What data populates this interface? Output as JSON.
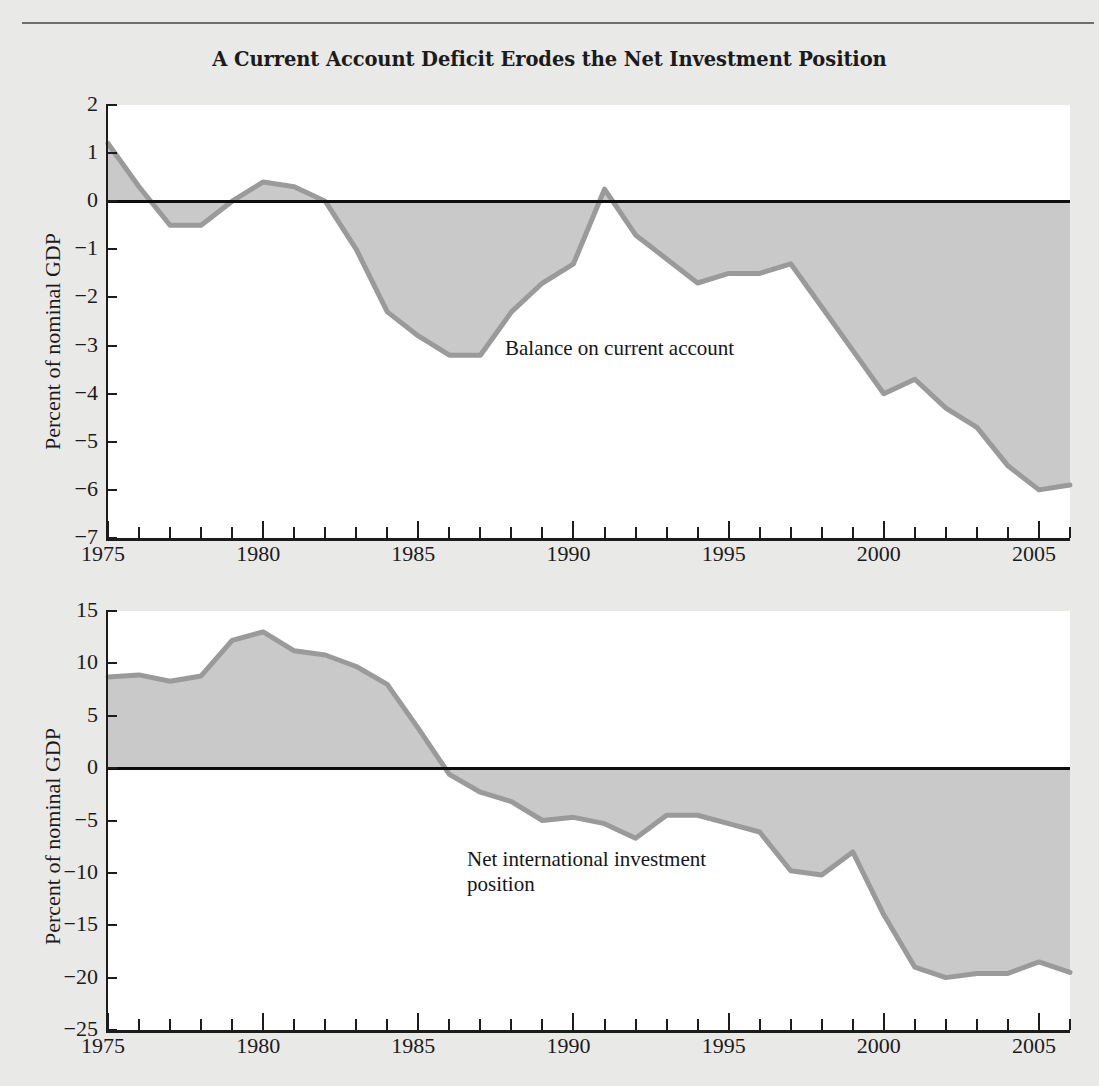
{
  "figure": {
    "title": "A Current Account Deficit Erodes the Net Investment Position",
    "background_color": "#e9e9e7",
    "plot_background_color": "#ffffff",
    "area_fill_color": "#c9c9c9",
    "series_line_color": "#9a9a9a",
    "axis_color": "#1c1c1c"
  },
  "chart_data": [
    {
      "type": "area",
      "panel": "top",
      "title": "A Current Account Deficit Erodes the Net Investment Position",
      "xlabel": "",
      "ylabel": "Percent of nominal GDP",
      "annotation": "Balance on current account",
      "legend_position": "inline-annotation",
      "grid": false,
      "xlim": [
        1975,
        2006
      ],
      "ylim": [
        -7,
        2
      ],
      "xticks_major": [
        1975,
        1980,
        1985,
        1990,
        1995,
        2000,
        2005
      ],
      "xticks_minor_step": 1,
      "ytick_labels": [
        "2",
        "1",
        "0",
        "−1",
        "−2",
        "−3",
        "−4",
        "−5",
        "−6",
        "−7"
      ],
      "yticks": [
        2,
        1,
        0,
        -1,
        -2,
        -3,
        -4,
        -5,
        -6,
        -7
      ],
      "x": [
        1975,
        1976,
        1977,
        1978,
        1979,
        1980,
        1981,
        1982,
        1983,
        1984,
        1985,
        1986,
        1987,
        1988,
        1989,
        1990,
        1991,
        1992,
        1993,
        1994,
        1995,
        1996,
        1997,
        1998,
        1999,
        2000,
        2001,
        2002,
        2003,
        2004,
        2005,
        2006
      ],
      "values": [
        1.2,
        0.3,
        -0.5,
        -0.5,
        0.0,
        0.4,
        0.3,
        0.0,
        -1.0,
        -2.3,
        -2.8,
        -3.2,
        -3.2,
        -2.3,
        -1.7,
        -1.3,
        0.25,
        -0.7,
        -1.2,
        -1.7,
        -1.5,
        -1.5,
        -1.3,
        -2.2,
        -3.1,
        -4.0,
        -3.7,
        -4.3,
        -4.7,
        -5.5,
        -6.0,
        -5.9
      ],
      "series": [
        {
          "name": "Balance on current account",
          "values": [
            1.2,
            0.3,
            -0.5,
            -0.5,
            0.0,
            0.4,
            0.3,
            0.0,
            -1.0,
            -2.3,
            -2.8,
            -3.2,
            -3.2,
            -2.3,
            -1.7,
            -1.3,
            0.25,
            -0.7,
            -1.2,
            -1.7,
            -1.5,
            -1.5,
            -1.3,
            -2.2,
            -3.1,
            -4.0,
            -3.7,
            -4.3,
            -4.7,
            -5.5,
            -6.0,
            -5.9
          ]
        }
      ]
    },
    {
      "type": "area",
      "panel": "bottom",
      "title": "",
      "xlabel": "",
      "ylabel": "Percent of nominal GDP",
      "annotation": "Net international investment\nposition",
      "legend_position": "inline-annotation",
      "grid": false,
      "xlim": [
        1975,
        2006
      ],
      "ylim": [
        -25,
        15
      ],
      "xticks_major": [
        1975,
        1980,
        1985,
        1990,
        1995,
        2000,
        2005
      ],
      "xticks_minor_step": 1,
      "ytick_labels": [
        "15",
        "10",
        "5",
        "0",
        "−5",
        "−10",
        "−15",
        "−20",
        "−25"
      ],
      "yticks": [
        15,
        10,
        5,
        0,
        -5,
        -10,
        -15,
        -20,
        -25
      ],
      "x": [
        1975,
        1976,
        1977,
        1978,
        1979,
        1980,
        1981,
        1982,
        1983,
        1984,
        1985,
        1986,
        1987,
        1988,
        1989,
        1990,
        1991,
        1992,
        1993,
        1994,
        1995,
        1996,
        1997,
        1998,
        1999,
        2000,
        2001,
        2002,
        2003,
        2004,
        2005,
        2006
      ],
      "values": [
        8.7,
        8.9,
        8.3,
        8.8,
        12.2,
        13.0,
        11.2,
        10.8,
        9.7,
        8.0,
        3.8,
        -0.6,
        -2.3,
        -3.2,
        -5.0,
        -4.7,
        -5.3,
        -6.7,
        -4.5,
        -4.5,
        -5.3,
        -6.1,
        -9.8,
        -10.2,
        -8.0,
        -14.0,
        -19.0,
        -20.0,
        -19.6,
        -19.6,
        -18.5,
        -19.5
      ],
      "series": [
        {
          "name": "Net international investment position",
          "values": [
            8.7,
            8.9,
            8.3,
            8.8,
            12.2,
            13.0,
            11.2,
            10.8,
            9.7,
            8.0,
            3.8,
            -0.6,
            -2.3,
            -3.2,
            -5.0,
            -4.7,
            -5.3,
            -6.7,
            -4.5,
            -4.5,
            -5.3,
            -6.1,
            -9.8,
            -10.2,
            -8.0,
            -14.0,
            -19.0,
            -20.0,
            -19.6,
            -19.6,
            -18.5,
            -19.5
          ]
        }
      ]
    }
  ]
}
